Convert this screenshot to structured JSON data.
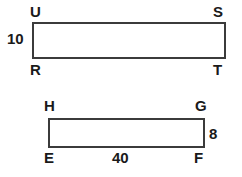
{
  "figure": {
    "background_color": "#ffffff",
    "stroke_color": "#3b3b3b",
    "text_color": "#1a1a1a",
    "shapes": [
      {
        "name": "upper-rectangle",
        "kind": "rectangle",
        "vertex_labels": {
          "top_left": "U",
          "top_right": "S",
          "bottom_left": "R",
          "bottom_right": "T"
        },
        "dimensions": {
          "height_label": "10",
          "width_label": ""
        }
      },
      {
        "name": "lower-rectangle",
        "kind": "rectangle",
        "vertex_labels": {
          "top_left": "H",
          "top_right": "G",
          "bottom_left": "E",
          "bottom_right": "F"
        },
        "dimensions": {
          "height_label": "8",
          "width_label": "40"
        }
      }
    ]
  }
}
